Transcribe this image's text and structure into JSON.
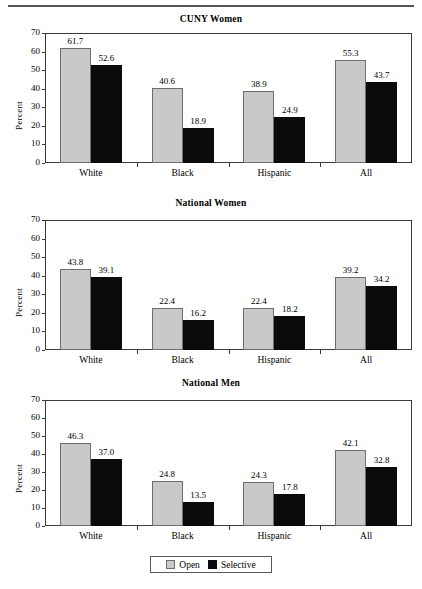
{
  "figure": {
    "has_top_rule": true,
    "width": 422,
    "height": 589
  },
  "legend": {
    "items": [
      {
        "label": "Open",
        "color": "#c9c9c9",
        "name": "legend-open"
      },
      {
        "label": "Selective",
        "color": "#0b0b0b",
        "name": "legend-selective"
      }
    ]
  },
  "chart_data": [
    {
      "type": "bar",
      "title": "CUNY Women",
      "xlabel": "",
      "ylabel": "Percent",
      "ylim": [
        0,
        70
      ],
      "yticks": [
        0,
        10,
        20,
        30,
        40,
        50,
        60,
        70
      ],
      "ytick_labels": [
        "0",
        "10",
        "20",
        "30",
        "40",
        "50",
        "60",
        "70"
      ],
      "grid": false,
      "legend_position": "bottom-figure",
      "categories": [
        "White",
        "Black",
        "Hispanic",
        "All"
      ],
      "series": [
        {
          "name": "Open",
          "color": "#c9c9c9",
          "values": [
            61.7,
            40.6,
            38.9,
            55.3
          ]
        },
        {
          "name": "Selective",
          "color": "#0b0b0b",
          "values": [
            52.6,
            18.9,
            24.9,
            43.7
          ]
        }
      ],
      "data_labels": [
        [
          "61.7",
          "40.6",
          "38.9",
          "55.3"
        ],
        [
          "52.6",
          "18.9",
          "24.9",
          "43.7"
        ]
      ]
    },
    {
      "type": "bar",
      "title": "National Women",
      "xlabel": "",
      "ylabel": "Percent",
      "ylim": [
        0,
        70
      ],
      "yticks": [
        0,
        10,
        20,
        30,
        40,
        50,
        60,
        70
      ],
      "ytick_labels": [
        "0",
        "10",
        "20",
        "30",
        "40",
        "50",
        "60",
        "70"
      ],
      "grid": false,
      "legend_position": "bottom-figure",
      "categories": [
        "White",
        "Black",
        "Hispanic",
        "All"
      ],
      "series": [
        {
          "name": "Open",
          "color": "#c9c9c9",
          "values": [
            43.8,
            22.4,
            22.4,
            39.2
          ]
        },
        {
          "name": "Selective",
          "color": "#0b0b0b",
          "values": [
            39.1,
            16.2,
            18.2,
            34.2
          ]
        }
      ],
      "data_labels": [
        [
          "43.8",
          "22.4",
          "22.4",
          "39.2"
        ],
        [
          "39.1",
          "16.2",
          "18.2",
          "34.2"
        ]
      ]
    },
    {
      "type": "bar",
      "title": "National Men",
      "xlabel": "",
      "ylabel": "Percent",
      "ylim": [
        0,
        70
      ],
      "yticks": [
        0,
        10,
        20,
        30,
        40,
        50,
        60,
        70
      ],
      "ytick_labels": [
        "0",
        "10",
        "20",
        "30",
        "40",
        "50",
        "60",
        "70"
      ],
      "grid": false,
      "legend_position": "bottom-figure",
      "categories": [
        "White",
        "Black",
        "Hispanic",
        "All"
      ],
      "series": [
        {
          "name": "Open",
          "color": "#c9c9c9",
          "values": [
            46.3,
            24.8,
            24.3,
            42.1
          ]
        },
        {
          "name": "Selective",
          "color": "#0b0b0b",
          "values": [
            37.0,
            13.5,
            17.8,
            32.8
          ]
        }
      ],
      "data_labels": [
        [
          "46.3",
          "24.8",
          "24.3",
          "42.1"
        ],
        [
          "37.0",
          "13.5",
          "17.8",
          "32.8"
        ]
      ]
    }
  ]
}
